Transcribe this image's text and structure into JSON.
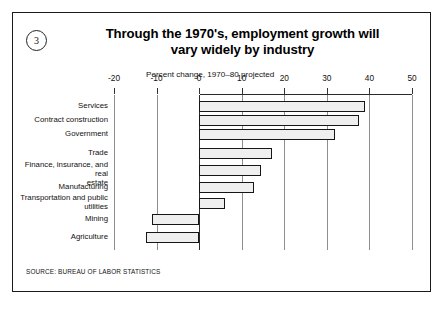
{
  "figure": {
    "badge_number": "3",
    "title_line_1": "Through the 1970's, employment growth will",
    "title_line_2": "vary widely by industry",
    "axis_caption": "Percent change, 1970–80 projected",
    "source_note": "SOURCE: BUREAU OF LABOR STATISTICS"
  },
  "chart_data": {
    "type": "bar",
    "orientation": "horizontal",
    "title": "Through the 1970's, employment growth will vary widely by industry",
    "subtitle": "Percent change, 1970–80 projected",
    "xlabel": "Percent change, 1970–80 projected",
    "ylabel": "",
    "xlim": [
      -20,
      50
    ],
    "xticks": [
      -20,
      -10,
      0,
      10,
      20,
      30,
      40,
      50
    ],
    "xticklabels": [
      "-20",
      "-10",
      "0",
      "10",
      "20",
      "30",
      "40",
      "50"
    ],
    "grid": true,
    "legend": false,
    "categories": [
      "Services",
      "Contract construction",
      "Government",
      "Trade",
      "Finance, insurance, and real estate",
      "Manufacturing",
      "Transportation and public utilities",
      "Mining",
      "Agriculture"
    ],
    "values": [
      39,
      37.5,
      32,
      17,
      14.5,
      13,
      6,
      -11,
      -12.5
    ],
    "bar_facecolor": "#efefef",
    "bar_edgecolor": "#161616",
    "source": "Bureau of Labor Statistics"
  },
  "categories_display": [
    {
      "lines": [
        "Services"
      ]
    },
    {
      "lines": [
        "Contract construction"
      ]
    },
    {
      "lines": [
        "Government"
      ]
    },
    {
      "lines": [
        "Trade"
      ]
    },
    {
      "lines": [
        "Finance, insurance, and real",
        "estate"
      ]
    },
    {
      "lines": [
        "Manufacturing"
      ]
    },
    {
      "lines": [
        "Transportation and public",
        "utilities"
      ]
    },
    {
      "lines": [
        "Mining"
      ]
    },
    {
      "lines": [
        "Agriculture"
      ]
    }
  ]
}
